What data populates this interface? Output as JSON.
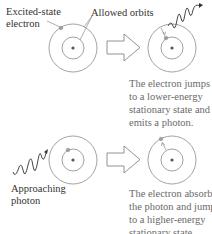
{
  "labels": {
    "excited_state_line1": "Excited-state",
    "excited_state_line2": "electron",
    "allowed_orbits": "Allowed orbits",
    "approaching_line1": "Approaching",
    "approaching_line2": "photon"
  },
  "captions": {
    "emission": [
      "The electron jumps",
      "to a lower-energy",
      "stationary state and",
      "emits a photon."
    ],
    "absorption": [
      "The electron absorbs",
      "the photon and jumps",
      "to a higher-energy",
      "stationary state."
    ]
  },
  "colors": {
    "orbit": "#8a8a8a",
    "nucleus": "#555555",
    "electron": "#a0a0a0",
    "photon": "#333333",
    "arrow": "#777777",
    "caption": "#6a6a6a"
  }
}
